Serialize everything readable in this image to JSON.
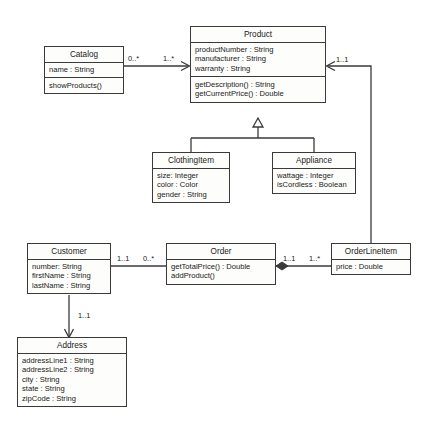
{
  "diagram": {
    "type": "uml-class-diagram",
    "background_color": "#ffffff",
    "line_color": "#3a3a3a",
    "class_fill_color": "#fdfdfb",
    "classes": [
      {
        "id": "catalog",
        "name": "Catalog",
        "attributes": [
          "name : String"
        ],
        "operations": [
          "showProducts()"
        ],
        "x": 44,
        "y": 46,
        "width": 80,
        "height": 42
      },
      {
        "id": "product",
        "name": "Product",
        "attributes": [
          "productNumber : String",
          "manufacturer : String",
          "warranty : String"
        ],
        "operations": [
          "getDescription() : String",
          "getCurrentPrice() : Double"
        ],
        "x": 190,
        "y": 26,
        "width": 136,
        "height": 92
      },
      {
        "id": "clothingitem",
        "name": "ClothingItem",
        "attributes": [
          "size: Integer",
          "color : Color",
          "gender : String"
        ],
        "operations": [],
        "x": 152,
        "y": 152,
        "width": 78,
        "height": 52
      },
      {
        "id": "appliance",
        "name": "Appliance",
        "attributes": [
          "wattage : Integer",
          "isCordless : Boolean"
        ],
        "operations": [],
        "x": 272,
        "y": 152,
        "width": 84,
        "height": 42
      },
      {
        "id": "customer",
        "name": "Customer",
        "attributes": [
          "number: String",
          "firstName : String",
          "lastName : String"
        ],
        "operations": [],
        "x": 27,
        "y": 243,
        "width": 84,
        "height": 52
      },
      {
        "id": "order",
        "name": "Order",
        "attributes": [],
        "operations": [
          "getTotalPrice() : Double",
          "addProduct()"
        ],
        "x": 166,
        "y": 243,
        "width": 110,
        "height": 42
      },
      {
        "id": "orderlineitem",
        "name": "OrderLineItem",
        "attributes": [
          "price : Double"
        ],
        "operations": [],
        "x": 331,
        "y": 243,
        "width": 80,
        "height": 32
      },
      {
        "id": "address",
        "name": "Address",
        "attributes": [
          "addressLine1 : String",
          "addressLine2 : String",
          "city : String",
          "state : String",
          "zipCode : String"
        ],
        "operations": [],
        "x": 17,
        "y": 337,
        "width": 110,
        "height": 82
      }
    ],
    "relationships": [
      {
        "id": "catalog-product",
        "kind": "association",
        "from": "catalog",
        "to": "product",
        "from_multiplicity": "0..*",
        "to_multiplicity": "1..*",
        "end_marker": "open-arrow"
      },
      {
        "id": "product-clothingitem",
        "kind": "generalization",
        "from": "clothingitem",
        "to": "product",
        "from_multiplicity": "",
        "to_multiplicity": "",
        "end_marker": "hollow-triangle"
      },
      {
        "id": "product-appliance",
        "kind": "generalization",
        "from": "appliance",
        "to": "product",
        "from_multiplicity": "",
        "to_multiplicity": "",
        "end_marker": "hollow-triangle"
      },
      {
        "id": "customer-order",
        "kind": "association",
        "from": "customer",
        "to": "order",
        "from_multiplicity": "1..1",
        "to_multiplicity": "0..*",
        "end_marker": "none"
      },
      {
        "id": "order-orderlineitem",
        "kind": "composition",
        "from": "order",
        "to": "orderlineitem",
        "from_multiplicity": "1..1",
        "to_multiplicity": "1..*",
        "end_marker": "filled-diamond"
      },
      {
        "id": "orderlineitem-product",
        "kind": "association",
        "from": "orderlineitem",
        "to": "product",
        "from_multiplicity": "",
        "to_multiplicity": "1..1",
        "end_marker": "open-arrow"
      },
      {
        "id": "customer-address",
        "kind": "association",
        "from": "customer",
        "to": "address",
        "from_multiplicity": "",
        "to_multiplicity": "1..1",
        "end_marker": "open-arrow"
      }
    ],
    "edge_labels": [
      {
        "id": "lbl-catalog-end",
        "text": "0..*",
        "x": 128,
        "y": 55
      },
      {
        "id": "lbl-product-end",
        "text": "1..*",
        "x": 163,
        "y": 55
      },
      {
        "id": "lbl-product-oli-end",
        "text": "1..1",
        "x": 336,
        "y": 56
      },
      {
        "id": "lbl-customer-order-a",
        "text": "1..1",
        "x": 117,
        "y": 255
      },
      {
        "id": "lbl-customer-order-b",
        "text": "0..*",
        "x": 143,
        "y": 255
      },
      {
        "id": "lbl-order-oli-a",
        "text": "1..1",
        "x": 283,
        "y": 255
      },
      {
        "id": "lbl-order-oli-b",
        "text": "1..*",
        "x": 309,
        "y": 255
      },
      {
        "id": "lbl-customer-address",
        "text": "1..1",
        "x": 78,
        "y": 312
      }
    ]
  }
}
